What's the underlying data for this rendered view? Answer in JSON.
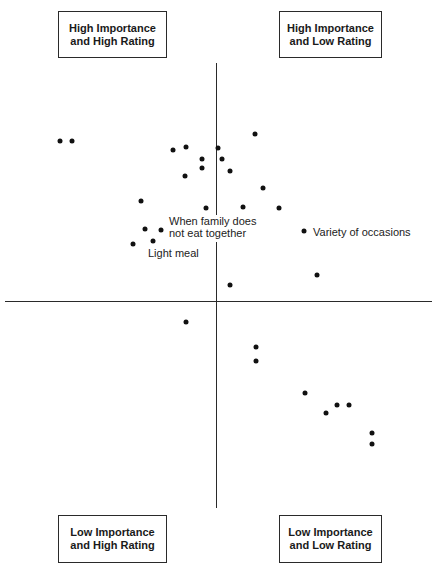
{
  "quadrants": {
    "top_left": {
      "line1": "High Importance",
      "line2": "and High Rating"
    },
    "top_right": {
      "line1": "High Importance",
      "line2": "and Low Rating"
    },
    "bottom_left": {
      "line1": "Low Importance",
      "line2": "and High Rating"
    },
    "bottom_right": {
      "line1": "Low Importance",
      "line2": "and Low Rating"
    }
  },
  "annotations": {
    "family": {
      "line1": "When family does",
      "line2": "not eat together"
    },
    "light_meal": "Light meal",
    "variety": "Variety of occasions"
  },
  "chart_data": {
    "type": "scatter",
    "title": "",
    "xlabel": "Rating (left = high, right = low)",
    "ylabel": "Importance (up = high, down = low)",
    "grid": false,
    "axes": "quadrant cross at center (0,0)",
    "quadrant_labels": [
      "High Importance and High Rating",
      "High Importance and Low Rating",
      "Low Importance and High Rating",
      "Low Importance and Low Rating"
    ],
    "annotations": [
      {
        "text": "When family does not eat together",
        "x": -0.29,
        "y": 0.3
      },
      {
        "text": "Light meal",
        "x": -0.39,
        "y": 0.26
      },
      {
        "text": "Variety of occasions",
        "x": 0.41,
        "y": 0.29
      }
    ],
    "points_px": [
      [
        60,
        141
      ],
      [
        72,
        141
      ],
      [
        173,
        150
      ],
      [
        186,
        147
      ],
      [
        218,
        148
      ],
      [
        255,
        134
      ],
      [
        202,
        159
      ],
      [
        222,
        159
      ],
      [
        202,
        168
      ],
      [
        230,
        171
      ],
      [
        185,
        176
      ],
      [
        263,
        188
      ],
      [
        141,
        201
      ],
      [
        206,
        208
      ],
      [
        243,
        207
      ],
      [
        279,
        208
      ],
      [
        145,
        229
      ],
      [
        161,
        230
      ],
      [
        133,
        244
      ],
      [
        153,
        241
      ],
      [
        304,
        231
      ],
      [
        317,
        275
      ],
      [
        230,
        285
      ],
      [
        186,
        322
      ],
      [
        256,
        347
      ],
      [
        256,
        361
      ],
      [
        305,
        393
      ],
      [
        337,
        405
      ],
      [
        349,
        405
      ],
      [
        326,
        413
      ],
      [
        372,
        433
      ],
      [
        372,
        444
      ]
    ],
    "points": [
      {
        "x": -0.73,
        "y": 0.66
      },
      {
        "x": -0.67,
        "y": 0.66
      },
      {
        "x": -0.2,
        "y": 0.62
      },
      {
        "x": -0.14,
        "y": 0.64
      },
      {
        "x": 0.01,
        "y": 0.63
      },
      {
        "x": 0.18,
        "y": 0.7
      },
      {
        "x": -0.06,
        "y": 0.59
      },
      {
        "x": 0.03,
        "y": 0.59
      },
      {
        "x": -0.06,
        "y": 0.55
      },
      {
        "x": 0.06,
        "y": 0.54
      },
      {
        "x": -0.14,
        "y": 0.52
      },
      {
        "x": 0.22,
        "y": 0.47
      },
      {
        "x": -0.35,
        "y": 0.41
      },
      {
        "x": -0.05,
        "y": 0.38
      },
      {
        "x": 0.12,
        "y": 0.39
      },
      {
        "x": 0.29,
        "y": 0.38
      },
      {
        "x": -0.33,
        "y": 0.3
      },
      {
        "x": -0.25,
        "y": 0.3
      },
      {
        "x": -0.38,
        "y": 0.24
      },
      {
        "x": -0.29,
        "y": 0.25
      },
      {
        "x": 0.41,
        "y": 0.29
      },
      {
        "x": 0.47,
        "y": 0.11
      },
      {
        "x": 0.06,
        "y": 0.07
      },
      {
        "x": -0.14,
        "y": -0.09
      },
      {
        "x": 0.19,
        "y": -0.19
      },
      {
        "x": 0.19,
        "y": -0.25
      },
      {
        "x": 0.41,
        "y": -0.39
      },
      {
        "x": 0.56,
        "y": -0.44
      },
      {
        "x": 0.61,
        "y": -0.44
      },
      {
        "x": 0.51,
        "y": -0.47
      },
      {
        "x": 0.72,
        "y": -0.55
      },
      {
        "x": 0.72,
        "y": -0.6
      }
    ],
    "xlim": [
      -1,
      1
    ],
    "ylim": [
      -1,
      1
    ]
  }
}
